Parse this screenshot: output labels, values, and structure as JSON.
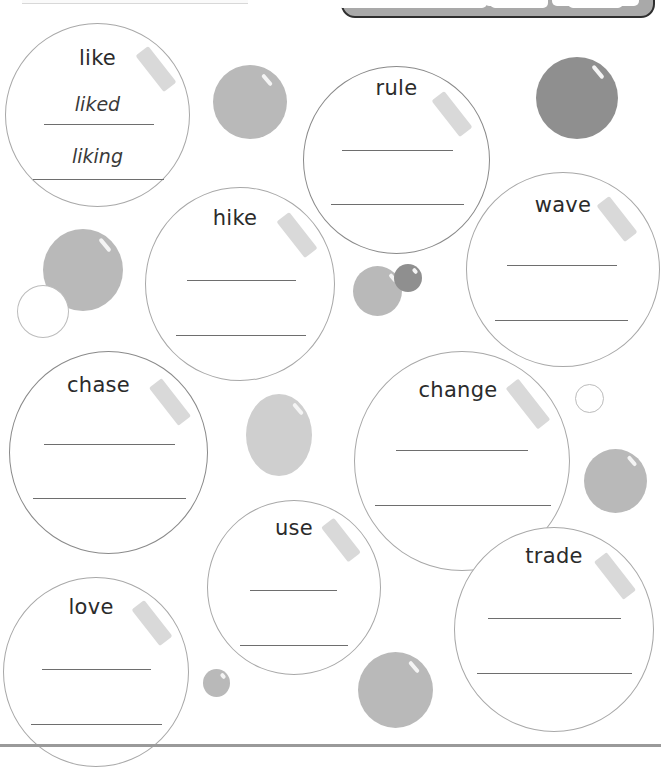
{
  "worksheet": {
    "word_bank": [
      "",
      "",
      "",
      ""
    ],
    "word_bank_partial": [
      "like",
      "-ed",
      "-ing",
      "driving"
    ],
    "bubbles": [
      {
        "id": "like",
        "word": "like",
        "answers": [
          "liked",
          "liking"
        ]
      },
      {
        "id": "rule",
        "word": "rule",
        "answers": [
          "",
          ""
        ]
      },
      {
        "id": "hike",
        "word": "hike",
        "answers": [
          "",
          ""
        ]
      },
      {
        "id": "wave",
        "word": "wave",
        "answers": [
          "",
          ""
        ]
      },
      {
        "id": "chase",
        "word": "chase",
        "answers": [
          "",
          ""
        ]
      },
      {
        "id": "change",
        "word": "change",
        "answers": [
          "",
          ""
        ]
      },
      {
        "id": "use",
        "word": "use",
        "answers": [
          "",
          ""
        ]
      },
      {
        "id": "trade",
        "word": "trade",
        "answers": [
          "",
          ""
        ]
      },
      {
        "id": "love",
        "word": "love",
        "answers": [
          "",
          ""
        ]
      }
    ]
  },
  "colors": {
    "word_box_fill": "#a9a9a9",
    "word_box_border": "#2e2e2e",
    "bubble_outline": "#a8a8a8",
    "gloss": "#d9d9d9",
    "deco_gray": "#b9b9b9",
    "deco_dark": "#8f8f8f",
    "text": "#2b2b2b"
  }
}
